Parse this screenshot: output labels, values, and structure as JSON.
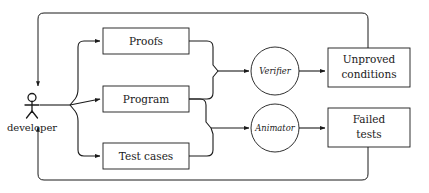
{
  "diagram": {
    "colors": {
      "stroke": "#1a1a1a",
      "background": "#ffffff",
      "fill": "#ffffff"
    },
    "actor": {
      "label": "developer",
      "icon": "stick-figure-actor-icon"
    },
    "artifacts": [
      {
        "id": "proofs",
        "label": "Proofs"
      },
      {
        "id": "program",
        "label": "Program"
      },
      {
        "id": "test-cases",
        "label": "Test cases"
      }
    ],
    "processors": [
      {
        "id": "verifier",
        "label": "Verifier"
      },
      {
        "id": "animator",
        "label": "Animator"
      }
    ],
    "outputs": [
      {
        "id": "unproved-conditions",
        "line1": "Unproved",
        "line2": "conditions"
      },
      {
        "id": "failed-tests",
        "line1": "Failed",
        "line2": "tests"
      }
    ],
    "edges": [
      {
        "from": "developer",
        "to": "proofs"
      },
      {
        "from": "developer",
        "to": "program"
      },
      {
        "from": "developer",
        "to": "test-cases"
      },
      {
        "from": "proofs",
        "to": "verifier"
      },
      {
        "from": "program",
        "to": "verifier"
      },
      {
        "from": "program",
        "to": "animator"
      },
      {
        "from": "test-cases",
        "to": "animator"
      },
      {
        "from": "verifier",
        "to": "unproved-conditions"
      },
      {
        "from": "animator",
        "to": "failed-tests"
      },
      {
        "from": "unproved-conditions",
        "to": "developer"
      },
      {
        "from": "failed-tests",
        "to": "developer"
      }
    ]
  }
}
